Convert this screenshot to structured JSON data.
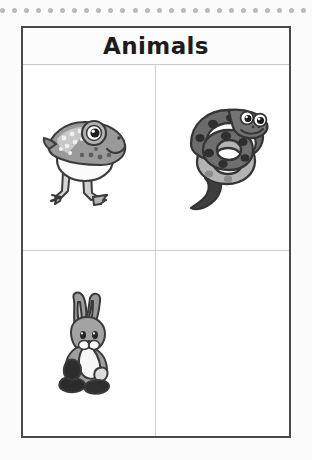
{
  "page": {
    "background_color": "#fbfbfb",
    "frame_border_color": "#4a4a4a",
    "grid_line_color": "#cfcfcf"
  },
  "decoration": {
    "dot_strip": {
      "name": "dot-strip",
      "dot_count": 26,
      "dot_color": "#b9b9b9"
    }
  },
  "worksheet": {
    "title": "Animals",
    "grid": {
      "columns": 2,
      "rows": 2,
      "cells": [
        {
          "position": "top-left",
          "content": "frog-illustration",
          "label": "frog",
          "empty": false
        },
        {
          "position": "top-right",
          "content": "snake-illustration",
          "label": "snake",
          "empty": false
        },
        {
          "position": "bottom-left",
          "content": "rabbit-illustration",
          "label": "rabbit",
          "empty": false
        },
        {
          "position": "bottom-right",
          "content": "",
          "label": "",
          "empty": true
        }
      ]
    }
  },
  "colors": {
    "ink": "#1c1c1c",
    "animal_gray_dark": "#4d4d4d",
    "animal_gray_mid": "#8f8f8f",
    "animal_gray_light": "#b8b8b8",
    "animal_white": "#f4f4f4"
  }
}
